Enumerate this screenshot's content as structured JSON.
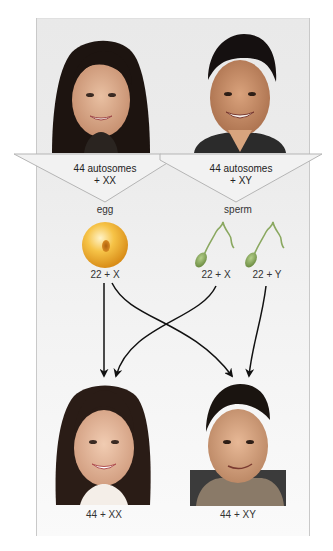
{
  "parents": {
    "mother": {
      "label_line1": "44 autosomes",
      "label_line2": "+ XX",
      "gamete_type": "egg",
      "gametes": [
        {
          "label": "22 + X",
          "icon": "egg-cell-icon"
        }
      ]
    },
    "father": {
      "label_line1": "44 autosomes",
      "label_line2": "+ XY",
      "gamete_type": "sperm",
      "gametes": [
        {
          "label": "22 + X",
          "icon": "sperm-cell-icon"
        },
        {
          "label": "22 + Y",
          "icon": "sperm-cell-icon"
        }
      ]
    }
  },
  "offspring": {
    "daughter": {
      "label": "44 + XX"
    },
    "son": {
      "label": "44 + XY"
    }
  },
  "colors": {
    "panel": "#ececec",
    "banner": "#f2f2f2",
    "banner_stroke": "#b8b8b8",
    "egg": "#f0b030",
    "sperm": "#8aa860",
    "arrow": "#111111"
  }
}
